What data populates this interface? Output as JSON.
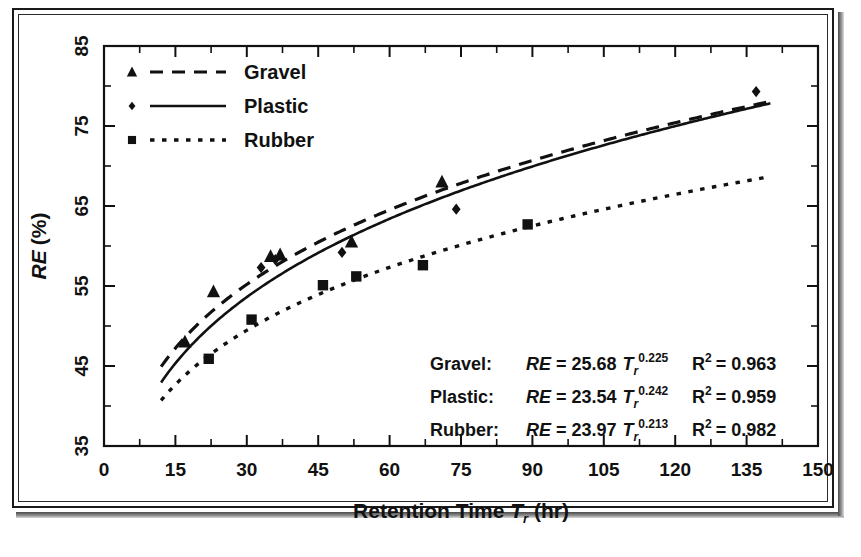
{
  "figure": {
    "axis_color": "#111111",
    "background": "#ffffff"
  },
  "chart_data": {
    "type": "scatter",
    "title": "",
    "xlabel": "Retention Time T_r (hr)",
    "ylabel": "RE (%)",
    "xlim": [
      0,
      150
    ],
    "ylim": [
      35,
      85
    ],
    "xticks": [
      0,
      15,
      30,
      45,
      60,
      75,
      90,
      105,
      120,
      135,
      150
    ],
    "yticks": [
      35,
      45,
      55,
      65,
      75,
      85
    ],
    "x_minor_step": 7.5,
    "y_minor_step": 5,
    "grid": false,
    "legend_position": "top-left",
    "series": [
      {
        "name": "Gravel",
        "marker": "triangle",
        "linestyle": "dashed",
        "fit_coefficient": 25.68,
        "fit_exponent": 0.225,
        "r_squared": 0.963,
        "points": [
          {
            "x": 17,
            "y": 48.0
          },
          {
            "x": 23,
            "y": 54.3
          },
          {
            "x": 35,
            "y": 58.7
          },
          {
            "x": 37,
            "y": 58.9
          },
          {
            "x": 52,
            "y": 60.5
          },
          {
            "x": 71,
            "y": 68.0
          }
        ]
      },
      {
        "name": "Plastic",
        "marker": "diamond",
        "linestyle": "solid",
        "fit_coefficient": 23.54,
        "fit_exponent": 0.242,
        "r_squared": 0.959,
        "points": [
          {
            "x": 33,
            "y": 57.3
          },
          {
            "x": 36,
            "y": 58.3
          },
          {
            "x": 50,
            "y": 59.2
          },
          {
            "x": 74,
            "y": 64.6
          },
          {
            "x": 137,
            "y": 79.3
          }
        ]
      },
      {
        "name": "Rubber",
        "marker": "square",
        "linestyle": "dotted",
        "fit_coefficient": 23.97,
        "fit_exponent": 0.213,
        "r_squared": 0.982,
        "points": [
          {
            "x": 22,
            "y": 45.9
          },
          {
            "x": 31,
            "y": 50.8
          },
          {
            "x": 46,
            "y": 55.1
          },
          {
            "x": 53,
            "y": 56.2
          },
          {
            "x": 67,
            "y": 57.6
          },
          {
            "x": 89,
            "y": 62.7
          }
        ]
      }
    ]
  },
  "legend": {
    "items": [
      {
        "label": "Gravel",
        "marker": "triangle",
        "linestyle": "dashed"
      },
      {
        "label": "Plastic",
        "marker": "diamond",
        "linestyle": "solid"
      },
      {
        "label": "Rubber",
        "marker": "square",
        "linestyle": "dotted"
      }
    ]
  },
  "equations": {
    "rows": [
      {
        "series_label": "Gravel:",
        "lhs": "RE",
        "equals": "= 25.68",
        "var_base": "T",
        "var_sub": "r",
        "exponent": "0.225",
        "r2_base": "R",
        "r2_sup": "2",
        "r2_value": "= 0.963"
      },
      {
        "series_label": "Plastic:",
        "lhs": "RE",
        "equals": "= 23.54",
        "var_base": "T",
        "var_sub": "r",
        "exponent": "0.242",
        "r2_base": "R",
        "r2_sup": "2",
        "r2_value": "= 0.959"
      },
      {
        "series_label": "Rubber:",
        "lhs": "RE",
        "equals": "= 23.97",
        "var_base": "T",
        "var_sub": "r",
        "exponent": "0.213",
        "r2_base": "R",
        "r2_sup": "2",
        "r2_value": "= 0.982"
      }
    ]
  },
  "axis_titles": {
    "x_part1": "Retention Time",
    "x_var": "T",
    "x_var_sub": "r",
    "x_part2": "(hr)",
    "y_var": "RE",
    "y_unit": "(%)"
  },
  "tick_labels": {
    "x": [
      "0",
      "15",
      "30",
      "45",
      "60",
      "75",
      "90",
      "105",
      "120",
      "135",
      "150"
    ],
    "y": [
      "35",
      "45",
      "55",
      "65",
      "75",
      "85"
    ]
  }
}
